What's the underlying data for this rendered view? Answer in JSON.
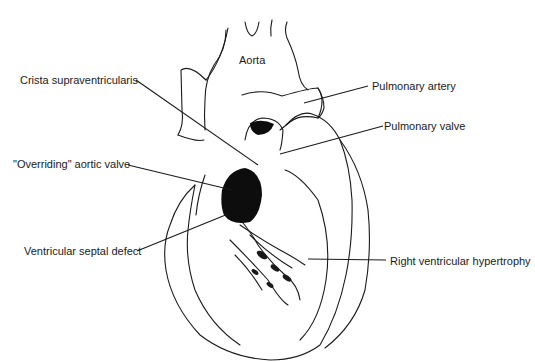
{
  "diagram": {
    "colors": {
      "line": "#1a1a1a",
      "fill_dark": "#0d0d0d",
      "background": "#ffffff"
    },
    "labels": [
      {
        "id": "aorta",
        "text": "Aorta"
      },
      {
        "id": "crista",
        "text": "Crista supraventricularis"
      },
      {
        "id": "pulm_artery",
        "text": "Pulmonary artery"
      },
      {
        "id": "pulm_valve",
        "text": "Pulmonary valve"
      },
      {
        "id": "overriding",
        "text": "\"Overriding\" aortic valve"
      },
      {
        "id": "vsd",
        "text": "Ventricular septal defect"
      },
      {
        "id": "rvh",
        "text": "Right ventricular hypertrophy"
      }
    ]
  }
}
